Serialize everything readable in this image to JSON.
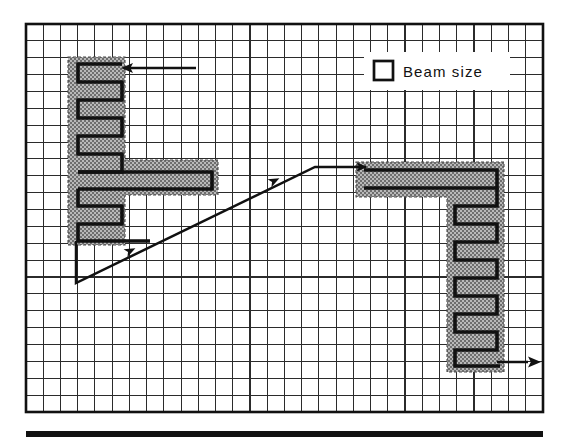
{
  "figure": {
    "title": "",
    "background_color": "#ffffff",
    "grid": {
      "x": 26,
      "y": 24,
      "width": 517,
      "height": 388,
      "columns": 30,
      "rows": 23,
      "cell_width": 17.23,
      "cell_height": 16.87,
      "line_color": "#1a1a1a",
      "line_width": 1.1,
      "border_color": "#111111",
      "border_width": 2.4,
      "fill_color": "#ffffff",
      "grid_visible": true
    },
    "hatch": {
      "fill_color": "#b4b4b4",
      "dot_color": "#6e6e6e",
      "outline_color": "#3a3a3a",
      "stroke_color": "#111111"
    },
    "baseline_bar": {
      "x": 26,
      "y": 431,
      "width": 517,
      "height": 6,
      "color": "#111111"
    },
    "legend": {
      "label": "Beam size",
      "panel": {
        "x": 364,
        "y": 52,
        "width": 144,
        "height": 38,
        "fill": "#ffffff"
      },
      "swatch": {
        "x": 374,
        "y": 61,
        "size": 19,
        "fill": "#ffffff",
        "stroke": "#111111",
        "stroke_width": 2.6
      },
      "text_x": 403,
      "text_y": 77
    },
    "shapes": [
      {
        "name": "left-scan-region",
        "type": "hatched-L",
        "description": "Vertical band with lower horizontal arm, hatched beam-size footprint",
        "band": {
          "x": 68,
          "y": 57,
          "width": 57,
          "height": 188
        },
        "arm": {
          "x": 68,
          "y": 160,
          "width": 150,
          "height": 35
        }
      },
      {
        "name": "right-scan-region",
        "type": "hatched-gamma",
        "description": "Upper horizontal arm with descending vertical band, hatched beam-size footprint",
        "arm": {
          "x": 356,
          "y": 162,
          "width": 148,
          "height": 35
        },
        "band": {
          "x": 447,
          "y": 162,
          "width": 57,
          "height": 210
        }
      }
    ],
    "scan_paths": [
      {
        "name": "left-serpentine",
        "stroke": "#111111",
        "stroke_width": 3.4,
        "points": [
          [
            121,
            64
          ],
          [
            78,
            64
          ],
          [
            78,
            81
          ],
          [
            121,
            81
          ],
          [
            121,
            98
          ],
          [
            78,
            98
          ],
          [
            78,
            115
          ],
          [
            121,
            115
          ],
          [
            121,
            132
          ],
          [
            78,
            132
          ],
          [
            78,
            149
          ],
          [
            121,
            149
          ],
          [
            121,
            166
          ],
          [
            78,
            166
          ],
          [
            78,
            183
          ],
          [
            214,
            183
          ],
          [
            214,
            166
          ],
          [
            78,
            166
          ],
          [
            78,
            200
          ],
          [
            78,
            200
          ],
          [
            121,
            200
          ],
          [
            121,
            217
          ],
          [
            78,
            217
          ],
          [
            78,
            234
          ],
          [
            121,
            234
          ]
        ]
      },
      {
        "name": "right-serpentine",
        "stroke": "#111111",
        "stroke_width": 3.4,
        "points": [
          [
            363,
            170
          ],
          [
            497,
            170
          ],
          [
            497,
            187
          ],
          [
            363,
            187
          ],
          [
            363,
            170
          ],
          [
            497,
            204
          ],
          [
            455,
            204
          ],
          [
            455,
            221
          ],
          [
            497,
            221
          ],
          [
            497,
            238
          ],
          [
            455,
            238
          ],
          [
            455,
            255
          ],
          [
            497,
            255
          ],
          [
            497,
            272
          ],
          [
            455,
            272
          ],
          [
            455,
            289
          ],
          [
            497,
            289
          ],
          [
            497,
            306
          ],
          [
            455,
            306
          ],
          [
            455,
            323
          ],
          [
            497,
            323
          ],
          [
            497,
            340
          ],
          [
            455,
            340
          ],
          [
            455,
            357
          ],
          [
            497,
            357
          ]
        ]
      }
    ],
    "connector": {
      "name": "beam-transfer-line",
      "stroke": "#111111",
      "stroke_width": 2.4,
      "vertical_drop": {
        "x": 76,
        "y_start": 234,
        "y_end": 283
      },
      "diagonal": {
        "x1": 76,
        "y1": 283,
        "x2": 315,
        "y2": 167
      },
      "horizontal": {
        "x1": 315,
        "y1": 167,
        "x2": 366,
        "y2": 167
      }
    },
    "arrows": [
      {
        "name": "beam-in-arrow",
        "direction": "left",
        "tail": [
          196,
          68
        ],
        "head": [
          122,
          68
        ],
        "stroke": "#111111",
        "stroke_width": 2.4,
        "head_size": 9
      },
      {
        "name": "transfer-arrow-lower",
        "direction": "up-right",
        "at": [
          130,
          251
        ],
        "angle_deg": -26,
        "head_size": 8
      },
      {
        "name": "transfer-arrow-upper",
        "direction": "up-right",
        "at": [
          274,
          181
        ],
        "angle_deg": -26,
        "head_size": 8
      },
      {
        "name": "transfer-arrow-entry",
        "direction": "right",
        "at": [
          366,
          167
        ],
        "head_size": 8
      },
      {
        "name": "beam-out-arrow",
        "direction": "right",
        "tail": [
          498,
          362
        ],
        "head": [
          541,
          362
        ],
        "stroke": "#111111",
        "stroke_width": 2.4,
        "head_size": 9
      }
    ]
  }
}
